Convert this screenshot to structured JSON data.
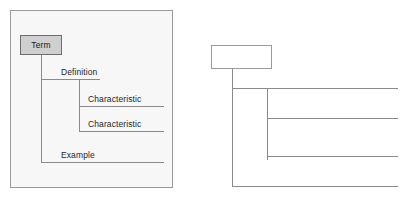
{
  "figure": {
    "background_color": "#ffffff",
    "line_color": "#8a8a8a",
    "text_color": "#1f1f1f"
  },
  "panels": [
    {
      "id": "labeled",
      "name": "labeled-tree-panel",
      "background_color": "#f7f7f7",
      "border_color": "#9a9a9a",
      "root": {
        "label": "Term",
        "fill_color": "#cfcfcf",
        "border_color": "#6e6e6e"
      },
      "branches": [
        {
          "label": "Definition",
          "level": 1
        },
        {
          "label": "Characteristic",
          "level": 2
        },
        {
          "label": "Characteristic",
          "level": 2
        },
        {
          "label": "Example",
          "level": 1
        }
      ]
    },
    {
      "id": "blank",
      "name": "blank-tree-panel",
      "background_color": "#ffffff",
      "root": {
        "label": "",
        "fill_color": "#ffffff",
        "border_color": "#9a9a9a"
      },
      "branches": [
        {
          "label": "",
          "level": 1
        },
        {
          "label": "",
          "level": 2
        },
        {
          "label": "",
          "level": 2
        },
        {
          "label": "",
          "level": 1
        }
      ]
    }
  ]
}
